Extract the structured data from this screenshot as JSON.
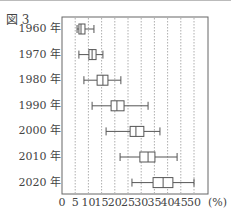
{
  "figure_label": "図 3",
  "unit_label": "(%)",
  "chart_data": {
    "type": "boxplot",
    "title": "図 3",
    "orientation": "horizontal",
    "xlabel": "(%)",
    "ylabel": "",
    "xlim": [
      0,
      55
    ],
    "xticks": [
      0,
      5,
      10,
      15,
      20,
      25,
      30,
      35,
      40,
      45,
      50
    ],
    "xtick_labels": [
      "0",
      "5",
      "10",
      "15",
      "20",
      "25",
      "30",
      "35",
      "40",
      "45",
      "50"
    ],
    "grid": "vertical dotted lines every 5",
    "categories": [
      "1960 年",
      "1970 年",
      "1980 年",
      "1990 年",
      "2000 年",
      "2010 年",
      "2020 年"
    ],
    "boxes": [
      {
        "label": "1960 年",
        "min": 5.7,
        "q1": 6.4,
        "median": 7.2,
        "q3": 8.7,
        "max": 12.1
      },
      {
        "label": "1970 年",
        "min": 6.4,
        "q1": 10.2,
        "median": 11.4,
        "q3": 12.9,
        "max": 15.5
      },
      {
        "label": "1980 年",
        "min": 8.3,
        "q1": 13.3,
        "median": 15.5,
        "q3": 17.4,
        "max": 22.3
      },
      {
        "label": "1990 年",
        "min": 11.4,
        "q1": 18.6,
        "median": 20.8,
        "q3": 23.5,
        "max": 32.6
      },
      {
        "label": "2000 年",
        "min": 16.7,
        "q1": 25.8,
        "median": 28.0,
        "q3": 31.0,
        "max": 37.1
      },
      {
        "label": "2010 年",
        "min": 22.0,
        "q1": 29.5,
        "median": 32.6,
        "q3": 35.2,
        "max": 43.6
      },
      {
        "label": "2020 年",
        "min": 26.5,
        "q1": 34.5,
        "median": 38.3,
        "q3": 42.0,
        "max": 50.0
      }
    ]
  },
  "colors": {
    "box_stroke": "#555555",
    "grid": "#999999",
    "frame": "#666666"
  }
}
